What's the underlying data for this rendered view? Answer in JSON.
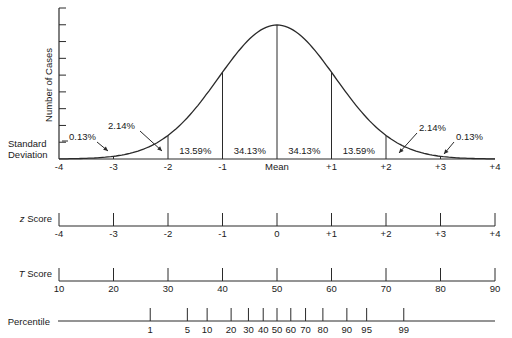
{
  "chart_data": {
    "type": "area",
    "ylabel": "Number of Cases",
    "xlabel": "Standard Deviation",
    "distribution": "normal",
    "mean_label": "Mean",
    "sd_ticks": [
      "-4",
      "-3",
      "-2",
      "-1",
      "Mean",
      "+1",
      "+2",
      "+3",
      "+4"
    ],
    "sd_values": [
      -4,
      -3,
      -2,
      -1,
      0,
      1,
      2,
      3,
      4
    ],
    "region_percentages": [
      {
        "from": -4,
        "to": -3,
        "label": "0.13%"
      },
      {
        "from": -3,
        "to": -2,
        "label": "2.14%"
      },
      {
        "from": -2,
        "to": -1,
        "label": "13.59%"
      },
      {
        "from": -1,
        "to": 0,
        "label": "34.13%"
      },
      {
        "from": 0,
        "to": 1,
        "label": "34.13%"
      },
      {
        "from": 1,
        "to": 2,
        "label": "13.59%"
      },
      {
        "from": 2,
        "to": 3,
        "label": "2.14%"
      },
      {
        "from": 3,
        "to": 4,
        "label": "0.13%"
      }
    ],
    "y_ticks_count": 9,
    "grid": false,
    "scales": [
      {
        "name": "z Score",
        "ticks": [
          "-4",
          "-3",
          "-2",
          "-1",
          "0",
          "+1",
          "+2",
          "+3",
          "+4"
        ],
        "z": [
          -4,
          -3,
          -2,
          -1,
          0,
          1,
          2,
          3,
          4
        ]
      },
      {
        "name": "T Score",
        "ticks": [
          "10",
          "20",
          "30",
          "40",
          "50",
          "60",
          "70",
          "80",
          "90"
        ],
        "z": [
          -4,
          -3,
          -2,
          -1,
          0,
          1,
          2,
          3,
          4
        ]
      },
      {
        "name": "Percentile",
        "ticks": [
          "1",
          "5",
          "10",
          "20",
          "30",
          "40",
          "50",
          "60",
          "70",
          "80",
          "90",
          "95",
          "99"
        ],
        "z": [
          -2.326,
          -1.645,
          -1.282,
          -0.842,
          -0.524,
          -0.253,
          0,
          0.253,
          0.524,
          0.842,
          1.282,
          1.645,
          2.326
        ]
      }
    ]
  },
  "labels": {
    "y_axis": "Number of Cases",
    "sd_line1": "Standard",
    "sd_line2": "Deviation",
    "z_prefix": "z",
    "z_suffix": " Score",
    "t_prefix": "T",
    "t_suffix": " Score",
    "percentile": "Percentile"
  }
}
